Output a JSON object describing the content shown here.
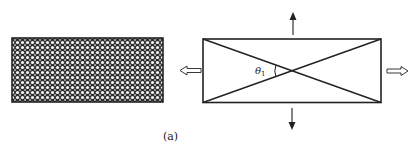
{
  "figure": {
    "caption": "(a)",
    "left_panel": {
      "description": "rectangle filled with dense woven/mesh pattern (crossed fibers)",
      "pattern": "crosshatch-mesh"
    },
    "right_panel": {
      "description": "rectangle with two diagonals crossing at center",
      "angle_label": "θ",
      "angle_subscript": "1"
    },
    "arrows": [
      {
        "name": "hollow-arrow-left",
        "direction": "left",
        "style": "hollow"
      },
      {
        "name": "hollow-arrow-right",
        "direction": "right",
        "style": "hollow"
      },
      {
        "name": "arrow-up",
        "direction": "up",
        "style": "solid"
      },
      {
        "name": "arrow-down",
        "direction": "down",
        "style": "solid"
      }
    ],
    "colors": {
      "stroke": "#222222",
      "mesh_dark": "#1a1a1a",
      "mesh_light": "#f4f4f4",
      "background": "#ffffff"
    }
  }
}
